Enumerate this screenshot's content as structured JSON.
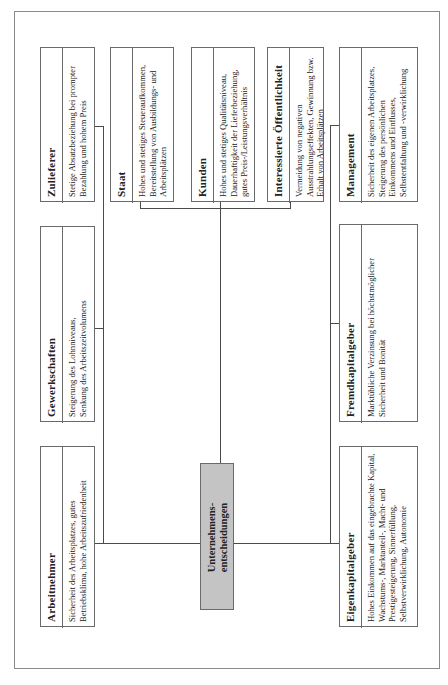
{
  "diagram": {
    "center": {
      "line1": "Unternehmens-",
      "line2": "entscheidungen",
      "fill_color": "#c4c4c4"
    },
    "stakeholders": [
      {
        "id": "zulieferer",
        "title": "Zulieferer",
        "description": "Stetige Absatzbeziehung bei prompter Bezahlung und hohem Preis"
      },
      {
        "id": "gewerkschaften",
        "title": "Gewerkschaften",
        "description": "Steigerung des Lohnniveaus, Senkung des Arbeitszeitvolumens"
      },
      {
        "id": "arbeitnehmer",
        "title": "Arbeitnehmer",
        "description": "Sicherheit des Arbeitsplatzes, gutes Betriebsklima, hohe Arbeitszufriedenheit"
      },
      {
        "id": "staat",
        "title": "Staat",
        "description": "Hohes und stetiges Steueraufkommen, Bereitstellung von Ausbildungs- und Arbeitsplätzen"
      },
      {
        "id": "kunden",
        "title": "Kunden",
        "description": "Hohes und stetiges Qualitätsniveau, Dauerhaftigkeit der Lieferbeziehung, gutes Preis-/Leistungsverhältnis"
      },
      {
        "id": "oeffentlichkeit",
        "title": "Interessierte Öffentlichkeit",
        "description": "Vermeidung von negativen Ausstrahlungseffekten, Gewinnung bzw. Erhalt von Arbeitsplätzen"
      },
      {
        "id": "management",
        "title": "Management",
        "description": "Sicherheit des eigenen Arbeitsplatzes, Steigerung des persönlichen Einkommens und Einflusses, Selbstentfaltung und -verwirklichung"
      },
      {
        "id": "fremdkapitalgeber",
        "title": "Fremdkapitalgeber",
        "description": "Marktübliche Verzinsung bei höchstmöglicher Sicherheit und Bonität"
      },
      {
        "id": "eigenkapitalgeber",
        "title": "Eigenkapitalgeber",
        "description": "Hohes Einkommen auf das eingebrachte Kapital, Wachstums-, Marktanteil-, Macht- und Prestigesteigerung, Sinnerfüllung, Selbstverwirklichung, Autonomie"
      }
    ]
  }
}
